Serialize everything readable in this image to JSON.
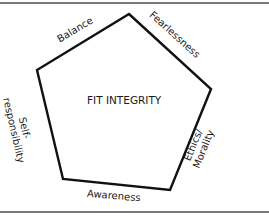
{
  "diagram": {
    "title": "FIT INTEGRITY",
    "shape": "pentagon",
    "stroke_color": "#111111",
    "rule_color": "#7a7a7a",
    "vertices": [
      [
        129,
        14
      ],
      [
        211,
        89
      ],
      [
        170,
        190
      ],
      [
        63,
        179
      ],
      [
        37,
        70
      ]
    ],
    "edges": [
      {
        "id": "balance",
        "label": "Balance"
      },
      {
        "id": "fearlessness",
        "label": "Fearlessness"
      },
      {
        "id": "ethics_morality",
        "label_line1": "Ethics/",
        "label_line2": "Morality"
      },
      {
        "id": "awareness",
        "label": "Awareness"
      },
      {
        "id": "self_responsibility",
        "label_line1": "Self-",
        "label_line2": "responsibility"
      }
    ]
  }
}
